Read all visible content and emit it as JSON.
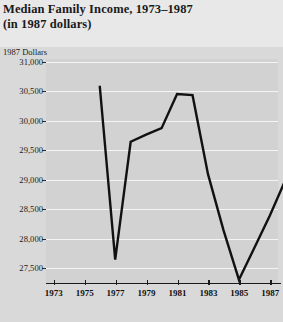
{
  "title": {
    "line1": "Median Family Income, 1973–1987",
    "line2": "(in 1987 dollars)"
  },
  "colors": {
    "figure_background": "#e8e8e8",
    "plot_background": "#d2d2d2",
    "gridline": "#f4f4f4",
    "line": "#111111",
    "text": "#1a1a1a"
  },
  "chart_data": {
    "type": "line",
    "title": "Median Family Income, 1973–1987 (in 1987 dollars)",
    "subtitle": "(in 1987 dollars)",
    "xlabel": "",
    "ylabel": "1987 Dollars",
    "ylim": [
      27250,
      31050
    ],
    "xlim": [
      1972.5,
      1987.5
    ],
    "grid": true,
    "legend": false,
    "yticks": [
      27500,
      28000,
      28500,
      29000,
      29500,
      30000,
      30500,
      31000
    ],
    "ytick_labels": [
      "27,500",
      "28,000",
      "28,500",
      "29,000",
      "29,500",
      "30,000",
      "30,500",
      "31,000"
    ],
    "xticks": [
      1973,
      1975,
      1977,
      1979,
      1981,
      1983,
      1985,
      1987
    ],
    "xtick_labels": [
      "1973",
      "1975",
      "1977",
      "1979",
      "1981",
      "1983",
      "1985",
      "1987"
    ],
    "x": [
      1973,
      1974,
      1975,
      1976,
      1977,
      1978,
      1979,
      1980,
      1981,
      1982,
      1983,
      1984,
      1985,
      1986,
      1987
    ],
    "values": [
      30800,
      27850,
      29850,
      29970,
      30080,
      30660,
      30640,
      29300,
      28350,
      27510,
      28050,
      28600,
      29200,
      30400,
      30770
    ],
    "series": [
      {
        "name": "Median family income",
        "values": [
          30800,
          27850,
          29850,
          29970,
          30080,
          30660,
          30640,
          29300,
          28350,
          27510,
          28050,
          28600,
          29200,
          30400,
          30770
        ]
      }
    ]
  }
}
